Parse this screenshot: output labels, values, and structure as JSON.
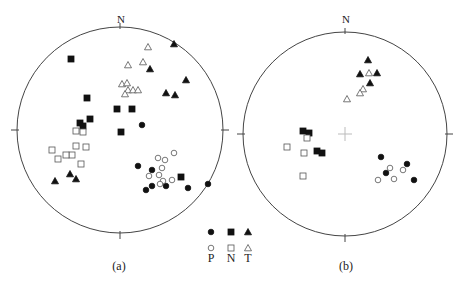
{
  "figure": {
    "panels": [
      {
        "id": "a",
        "label": "(a)",
        "north_label": "N",
        "center": [
          120,
          130
        ],
        "radius": 103,
        "show_center_cross": false,
        "points": {
          "P_filled": [
            [
              142,
              125
            ],
            [
              138,
              166
            ],
            [
              152,
              170
            ],
            [
              146,
              190
            ],
            [
              152,
              186
            ],
            [
              166,
              186
            ],
            [
              188,
              188
            ],
            [
              208,
              184
            ]
          ],
          "P_open": [
            [
              158,
              158
            ],
            [
              165,
              160
            ],
            [
              174,
              153
            ],
            [
              162,
              168
            ],
            [
              159,
              175
            ],
            [
              149,
              176
            ],
            [
              163,
              181
            ],
            [
              160,
              184
            ],
            [
              172,
              180
            ]
          ],
          "N_filled": [
            [
              71,
              59
            ],
            [
              87,
              98
            ],
            [
              117,
              109
            ],
            [
              132,
              109
            ],
            [
              90,
              119
            ],
            [
              80,
              123
            ],
            [
              83,
              126
            ],
            [
              121,
              132
            ],
            [
              181,
              177
            ]
          ],
          "N_open": [
            [
              76,
              131
            ],
            [
              83,
              132
            ],
            [
              76,
              146
            ],
            [
              86,
              147
            ],
            [
              52,
              150
            ],
            [
              72,
              155
            ],
            [
              66,
              155
            ],
            [
              58,
              159
            ],
            [
              81,
              164
            ]
          ],
          "T_filled": [
            [
              174,
              44
            ],
            [
              150,
              69
            ],
            [
              186,
              80
            ],
            [
              166,
              93
            ],
            [
              175,
              95
            ],
            [
              55,
              181
            ],
            [
              70,
              174
            ],
            [
              76,
              179
            ]
          ],
          "T_open": [
            [
              148,
              47
            ],
            [
              143,
              62
            ],
            [
              128,
              65
            ],
            [
              122,
              84
            ],
            [
              127,
              83
            ],
            [
              128,
              90
            ],
            [
              133,
              90
            ],
            [
              138,
              90
            ],
            [
              125,
              94
            ]
          ]
        }
      },
      {
        "id": "b",
        "label": "(b)",
        "north_label": "N",
        "center": [
          345,
          134
        ],
        "radius": 102,
        "show_center_cross": true,
        "points": {
          "P_filled": [
            [
              381,
              157
            ],
            [
              386,
              173
            ],
            [
              407,
              164
            ],
            [
              414,
              180
            ]
          ],
          "P_open": [
            [
              390,
              168
            ],
            [
              403,
              170
            ],
            [
              394,
              179
            ],
            [
              378,
              180
            ]
          ],
          "N_filled": [
            [
              303,
              131
            ],
            [
              309,
              133
            ],
            [
              317,
              151
            ],
            [
              322,
              153
            ]
          ],
          "N_open": [
            [
              287,
              147
            ],
            [
              307,
              138
            ],
            [
              304,
              153
            ],
            [
              303,
              176
            ]
          ],
          "T_filled": [
            [
              368,
              60
            ],
            [
              360,
              74
            ],
            [
              377,
              73
            ],
            [
              370,
              83
            ]
          ],
          "T_open": [
            [
              369,
              73
            ],
            [
              363,
              89
            ],
            [
              360,
              93
            ],
            [
              347,
              99
            ]
          ]
        }
      }
    ],
    "legend": {
      "columns": [
        {
          "name": "P",
          "filled": "circle",
          "open": "circle"
        },
        {
          "name": "N",
          "filled": "square",
          "open": "square"
        },
        {
          "name": "T",
          "filled": "triangle",
          "open": "triangle"
        }
      ],
      "labels": [
        "P",
        "N",
        "T"
      ]
    },
    "colors": {
      "ink": "#111111",
      "circle": "#444444",
      "cross": "#bbbbbb"
    }
  }
}
